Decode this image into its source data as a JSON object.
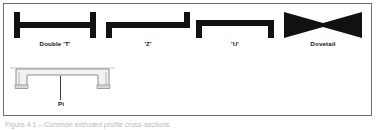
{
  "figure": {
    "frame": {
      "border_color": "#6f6f6f",
      "background_color": "#ffffff"
    },
    "shape_fill_color": "#111111",
    "outline_color": "#8c8c8c",
    "leader_color": "#3a3a3a",
    "caption": "Figure 4.1 – Common extruded profile cross-sections"
  },
  "profiles": [
    {
      "id": "double-t",
      "label": "Double 'T'",
      "shape": "double-t-profile-icon",
      "description": "I-beam profile with vertical flanges at both ends joined by a horizontal web"
    },
    {
      "id": "z",
      "label": "'Z'",
      "shape": "z-profile-icon",
      "description": "Z profile with lower flange on the left and upper flange on the right"
    },
    {
      "id": "u",
      "label": "'U'",
      "shape": "u-profile-icon",
      "description": "U channel profile with both ends turned downward"
    },
    {
      "id": "dovetail",
      "label": "Dovetail",
      "shape": "dovetail-profile-icon",
      "description": "Bowtie shaped dovetail profile, wide at both ends and pinched at the centre"
    }
  ],
  "pi_profile": {
    "id": "pi",
    "label": "Pi",
    "shape": "pi-profile-icon",
    "description": "Hollow outlined Pi channel profile with two downturned legs"
  }
}
